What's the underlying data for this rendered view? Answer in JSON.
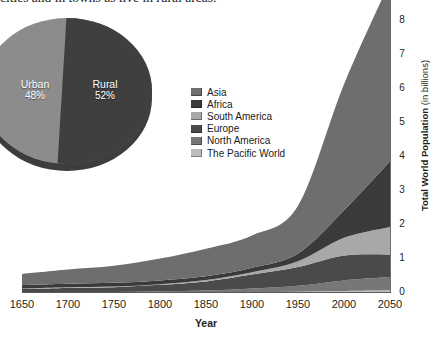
{
  "caption": {
    "text": "cities and in towns as live in rural areas."
  },
  "pie": {
    "title": "",
    "slices": [
      {
        "label": "Urban",
        "pct_label": "48%",
        "value": 48,
        "color": "#8c8c8c"
      },
      {
        "label": "Rural",
        "pct_label": "52%",
        "value": 52,
        "color": "#3f3f3f"
      }
    ]
  },
  "legend": {
    "items": [
      {
        "label": "Asia",
        "color": "#6e6e6e"
      },
      {
        "label": "Africa",
        "color": "#3a3a3a"
      },
      {
        "label": "South America",
        "color": "#a8a8a8"
      },
      {
        "label": "Europe",
        "color": "#4a4a4a"
      },
      {
        "label": "North America",
        "color": "#777777"
      },
      {
        "label": "The Pacific World",
        "color": "#bdbdbd"
      }
    ]
  },
  "axes": {
    "x_title": "Year",
    "y_title_bold": "Total World Population",
    "y_title_regular": " (in billions)",
    "x_ticks": [
      "1650",
      "1700",
      "1750",
      "1800",
      "1850",
      "1900",
      "1950",
      "2000",
      "2050"
    ],
    "y_ticks": [
      "0",
      "1",
      "2",
      "3",
      "4",
      "5",
      "6",
      "7",
      "8"
    ]
  },
  "chart_data": {
    "type": "area",
    "stacked": true,
    "title": "",
    "xlabel": "Year",
    "ylabel": "Total World Population (in billions)",
    "xlim": [
      1650,
      2050
    ],
    "ylim": [
      0,
      8.6
    ],
    "grid": false,
    "legend_position": "center-left",
    "x": [
      1650,
      1700,
      1750,
      1800,
      1850,
      1900,
      1950,
      2000,
      2050
    ],
    "series": [
      {
        "name": "The Pacific World",
        "color": "#bdbdbd",
        "values": [
          0.01,
          0.01,
          0.01,
          0.02,
          0.02,
          0.03,
          0.04,
          0.06,
          0.08
        ]
      },
      {
        "name": "North America",
        "color": "#777777",
        "values": [
          0.01,
          0.02,
          0.02,
          0.03,
          0.05,
          0.1,
          0.17,
          0.31,
          0.39
        ]
      },
      {
        "name": "Europe",
        "color": "#4a4a4a",
        "values": [
          0.1,
          0.12,
          0.14,
          0.19,
          0.27,
          0.41,
          0.55,
          0.73,
          0.66
        ]
      },
      {
        "name": "South America",
        "color": "#a8a8a8",
        "values": [
          0.01,
          0.02,
          0.02,
          0.02,
          0.04,
          0.07,
          0.17,
          0.52,
          0.81
        ]
      },
      {
        "name": "Africa",
        "color": "#3a3a3a",
        "values": [
          0.1,
          0.1,
          0.11,
          0.11,
          0.11,
          0.13,
          0.23,
          0.81,
          1.93
        ]
      },
      {
        "name": "Asia",
        "color": "#6e6e6e",
        "values": [
          0.33,
          0.42,
          0.5,
          0.64,
          0.81,
          0.95,
          1.4,
          3.7,
          5.27
        ]
      }
    ],
    "totals": [
      0.56,
      0.69,
      0.8,
      1.01,
      1.3,
      1.69,
      2.56,
      6.13,
      9.14
    ]
  }
}
